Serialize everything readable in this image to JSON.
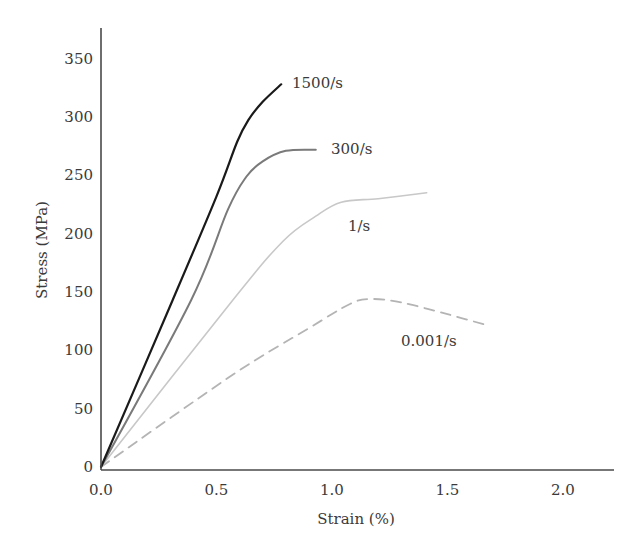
{
  "chart_data": {
    "type": "line",
    "title": "",
    "xlabel": "Strain (%)",
    "ylabel": "Stress (MPa)",
    "xlim": [
      0,
      2.2
    ],
    "ylim": [
      0,
      375
    ],
    "grid": false,
    "legend_position": "inline labels at curve ends",
    "x_ticks": [
      0.0,
      0.5,
      1.0,
      1.5,
      2.0
    ],
    "x_tick_labels": [
      "0.0",
      "0.5",
      "1.0",
      "1.5",
      "2.0"
    ],
    "y_ticks": [
      0,
      50,
      100,
      150,
      200,
      250,
      300,
      350
    ],
    "y_tick_labels": [
      "0",
      "50",
      "100",
      "150",
      "200",
      "250",
      "300",
      "350"
    ],
    "series": [
      {
        "name": "1500/s",
        "color": "#1a1a1a",
        "dash": "solid",
        "width": 2.2,
        "label_pos": [
          292,
          88
        ],
        "points": [
          [
            0,
            0
          ],
          [
            0.31,
            143
          ],
          [
            0.5,
            232
          ],
          [
            0.59,
            279
          ],
          [
            0.64,
            298
          ],
          [
            0.7,
            313
          ],
          [
            0.78,
            328
          ]
        ]
      },
      {
        "name": "300/s",
        "color": "#7a7a7a",
        "dash": "solid",
        "width": 2,
        "label_pos": [
          331,
          154
        ],
        "points": [
          [
            0,
            0
          ],
          [
            0.39,
            143
          ],
          [
            0.55,
            221
          ],
          [
            0.63,
            249
          ],
          [
            0.7,
            262
          ],
          [
            0.8,
            271
          ],
          [
            0.93,
            272
          ]
        ]
      },
      {
        "name": "1/s",
        "color": "#c8c8c8",
        "dash": "solid",
        "width": 1.6,
        "label_pos": [
          348,
          231
        ],
        "points": [
          [
            0,
            0
          ],
          [
            0.57,
            143
          ],
          [
            0.79,
            194
          ],
          [
            0.93,
            215
          ],
          [
            1.04,
            227
          ],
          [
            1.2,
            230
          ],
          [
            1.41,
            235
          ]
        ]
      },
      {
        "name": "0.001/s",
        "color": "#b4b4b4",
        "dash": "dashed",
        "width": 1.8,
        "label_pos": [
          401,
          346
        ],
        "points": [
          [
            0,
            0
          ],
          [
            0.57,
            79
          ],
          [
            0.9,
            119
          ],
          [
            1.08,
            140
          ],
          [
            1.17,
            144
          ],
          [
            1.3,
            141
          ],
          [
            1.5,
            131
          ],
          [
            1.68,
            121
          ]
        ]
      }
    ]
  }
}
